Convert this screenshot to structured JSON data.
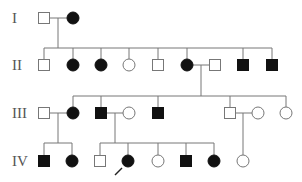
{
  "diagram": {
    "type": "pedigree",
    "colors": {
      "affected": "#111111",
      "unaffected": "#ffffff",
      "line": "#777777"
    },
    "generations": [
      {
        "label": "I",
        "y": 18
      },
      {
        "label": "II",
        "y": 65
      },
      {
        "label": "III",
        "y": 113
      },
      {
        "label": "IV",
        "y": 161
      }
    ],
    "individuals": [
      {
        "id": "I-1",
        "sex": "male",
        "affected": false,
        "x": 44,
        "y": 18
      },
      {
        "id": "I-2",
        "sex": "female",
        "affected": true,
        "x": 73,
        "y": 18
      },
      {
        "id": "II-1",
        "sex": "male",
        "affected": false,
        "x": 44,
        "y": 65
      },
      {
        "id": "II-2",
        "sex": "female",
        "affected": true,
        "x": 73,
        "y": 65
      },
      {
        "id": "II-3",
        "sex": "female",
        "affected": true,
        "x": 101,
        "y": 65
      },
      {
        "id": "II-4",
        "sex": "female",
        "affected": false,
        "x": 129,
        "y": 65
      },
      {
        "id": "II-5",
        "sex": "male",
        "affected": false,
        "x": 158,
        "y": 65
      },
      {
        "id": "II-6",
        "sex": "female",
        "affected": true,
        "x": 187,
        "y": 65
      },
      {
        "id": "II-7",
        "sex": "male",
        "affected": false,
        "x": 215,
        "y": 65
      },
      {
        "id": "II-8",
        "sex": "male",
        "affected": true,
        "x": 243,
        "y": 65
      },
      {
        "id": "II-9",
        "sex": "male",
        "affected": true,
        "x": 272,
        "y": 65
      },
      {
        "id": "III-1",
        "sex": "male",
        "affected": false,
        "x": 44,
        "y": 113
      },
      {
        "id": "III-2",
        "sex": "female",
        "affected": true,
        "x": 73,
        "y": 113
      },
      {
        "id": "III-3",
        "sex": "male",
        "affected": true,
        "x": 101,
        "y": 113
      },
      {
        "id": "III-4",
        "sex": "female",
        "affected": false,
        "x": 129,
        "y": 113
      },
      {
        "id": "III-5",
        "sex": "male",
        "affected": true,
        "x": 158,
        "y": 113
      },
      {
        "id": "III-6",
        "sex": "male",
        "affected": false,
        "x": 230,
        "y": 113
      },
      {
        "id": "III-7",
        "sex": "female",
        "affected": false,
        "x": 258,
        "y": 113
      },
      {
        "id": "III-8",
        "sex": "female",
        "affected": false,
        "x": 286,
        "y": 113
      },
      {
        "id": "IV-1",
        "sex": "male",
        "affected": true,
        "x": 44,
        "y": 161
      },
      {
        "id": "IV-2",
        "sex": "female",
        "affected": true,
        "x": 72,
        "y": 161
      },
      {
        "id": "IV-3",
        "sex": "male",
        "affected": false,
        "x": 100,
        "y": 161
      },
      {
        "id": "IV-4",
        "sex": "female",
        "affected": true,
        "x": 128,
        "y": 161,
        "proband": true
      },
      {
        "id": "IV-5",
        "sex": "female",
        "affected": false,
        "x": 158,
        "y": 161
      },
      {
        "id": "IV-6",
        "sex": "male",
        "affected": true,
        "x": 186,
        "y": 161
      },
      {
        "id": "IV-7",
        "sex": "female",
        "affected": true,
        "x": 214,
        "y": 161
      },
      {
        "id": "IV-8",
        "sex": "female",
        "affected": false,
        "x": 243,
        "y": 161
      }
    ],
    "lines": [
      [
        50,
        18,
        67,
        18
      ],
      [
        58,
        18,
        58,
        48
      ],
      [
        44,
        48,
        272,
        48
      ],
      [
        44,
        48,
        44,
        59
      ],
      [
        73,
        48,
        73,
        59
      ],
      [
        101,
        48,
        101,
        59
      ],
      [
        129,
        48,
        129,
        59
      ],
      [
        158,
        48,
        158,
        59
      ],
      [
        187,
        48,
        187,
        59
      ],
      [
        243,
        48,
        243,
        59
      ],
      [
        272,
        48,
        272,
        59
      ],
      [
        193,
        65,
        209,
        65
      ],
      [
        201,
        65,
        201,
        96
      ],
      [
        73,
        96,
        286,
        96
      ],
      [
        73,
        96,
        73,
        107
      ],
      [
        101,
        96,
        101,
        107
      ],
      [
        158,
        96,
        158,
        107
      ],
      [
        230,
        96,
        230,
        107
      ],
      [
        286,
        96,
        286,
        107
      ],
      [
        50,
        113,
        67,
        113
      ],
      [
        58,
        113,
        58,
        143
      ],
      [
        44,
        143,
        72,
        143
      ],
      [
        44,
        143,
        44,
        155
      ],
      [
        72,
        143,
        72,
        155
      ],
      [
        107,
        113,
        123,
        113
      ],
      [
        115,
        113,
        115,
        143
      ],
      [
        100,
        143,
        214,
        143
      ],
      [
        100,
        143,
        100,
        155
      ],
      [
        128,
        143,
        128,
        155
      ],
      [
        158,
        143,
        158,
        155
      ],
      [
        186,
        143,
        186,
        155
      ],
      [
        214,
        143,
        214,
        155
      ],
      [
        236,
        113,
        252,
        113
      ],
      [
        243,
        113,
        243,
        155
      ]
    ],
    "proband_arrow": {
      "x1": 115,
      "y1": 175,
      "x2": 122,
      "y2": 168
    }
  }
}
